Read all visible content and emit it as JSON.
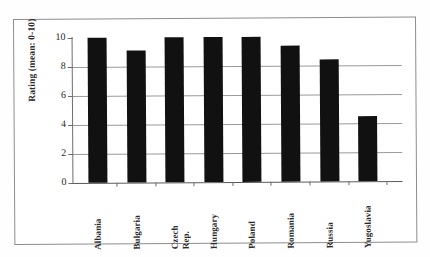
{
  "chart_data": {
    "type": "bar",
    "title": "",
    "xlabel": "",
    "ylabel": "Rating (mean: 0-10)",
    "categories": [
      "Albania",
      "Bulgaria",
      "Czech Rep.",
      "Hungary",
      "Poland",
      "Romania",
      "Russia",
      "Yugoslavia"
    ],
    "values": [
      10.0,
      9.1,
      10.0,
      10.0,
      10.0,
      9.4,
      8.4,
      4.5
    ],
    "ylim": [
      0,
      10
    ],
    "ytick_labels": [
      "10",
      "8",
      "6",
      "4",
      "2",
      "0"
    ],
    "ytick_values": [
      10,
      8,
      6,
      4,
      2,
      0
    ],
    "grid": true,
    "legend": "none",
    "bar_color": "#111111",
    "grid_color": "#9a9a9a",
    "axis_color": "#6e6e6e"
  },
  "category_labels_wrapped": [
    [
      "Albania"
    ],
    [
      "Bulgaria"
    ],
    [
      "Czech",
      "Rep."
    ],
    [
      "Hungary"
    ],
    [
      "Poland"
    ],
    [
      "Romania"
    ],
    [
      "Russia"
    ],
    [
      "Yugoslavia"
    ]
  ]
}
